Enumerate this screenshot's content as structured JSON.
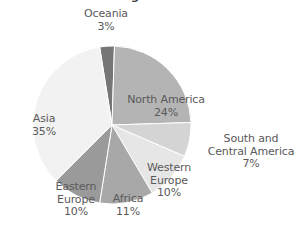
{
  "chart_data": {
    "type": "pie",
    "title": "different regions of the world",
    "xlabel": "",
    "ylabel": "",
    "legend_position": "none",
    "grid": false,
    "start_angle_deg": -9,
    "direction": "clockwise",
    "categories": [
      "Oceania",
      "North America",
      "South and Central America",
      "Western Europe",
      "Africa",
      "Eastern Europe",
      "Asia"
    ],
    "values": [
      3,
      24,
      7,
      10,
      11,
      10,
      35
    ],
    "unit": "%",
    "slices": [
      {
        "name": "Oceania",
        "value": 3,
        "value_label": "3%",
        "label_lines": [
          "Oceania",
          "3%"
        ],
        "color": "#767676",
        "label_placement": "outside-top"
      },
      {
        "name": "North America",
        "value": 24,
        "value_label": "24%",
        "label_lines": [
          "North America",
          "24%"
        ],
        "color": "#b4b4b4",
        "label_placement": "inside"
      },
      {
        "name": "South and Central America",
        "value": 7,
        "value_label": "7%",
        "label_lines": [
          "South and",
          "Central America",
          "7%"
        ],
        "color": "#d4d4d4",
        "label_placement": "outside-right"
      },
      {
        "name": "Western Europe",
        "value": 10,
        "value_label": "10%",
        "label_lines": [
          "Western",
          "Europe",
          "10%"
        ],
        "color": "#e6e6e6",
        "label_placement": "inside"
      },
      {
        "name": "Africa",
        "value": 11,
        "value_label": "11%",
        "label_lines": [
          "Africa",
          "11%"
        ],
        "color": "#a8a8a8",
        "label_placement": "inside"
      },
      {
        "name": "Eastern Europe",
        "value": 10,
        "value_label": "10%",
        "label_lines": [
          "Eastern",
          "Europe",
          "10%"
        ],
        "color": "#9a9a9a",
        "label_placement": "inside"
      },
      {
        "name": "Asia",
        "value": 35,
        "value_label": "35%",
        "label_lines": [
          "Asia",
          "35%"
        ],
        "color": "#f2f2f2",
        "label_placement": "inside"
      }
    ]
  },
  "labels": {
    "oceania": {
      "name": "Oceania",
      "value": "3%"
    },
    "north_america": {
      "name": "North America",
      "value": "24%"
    },
    "south_central_america": {
      "line1": "South and",
      "line2": "Central America",
      "value": "7%"
    },
    "western_europe": {
      "line1": "Western",
      "line2": "Europe",
      "value": "10%"
    },
    "africa": {
      "name": "Africa",
      "value": "11%"
    },
    "eastern_europe": {
      "line1": "Eastern",
      "line2": "Europe",
      "value": "10%"
    },
    "asia": {
      "name": "Asia",
      "value": "35%"
    }
  },
  "title": {
    "text": "different regions of the world"
  },
  "colors": {
    "background": "#ffffff",
    "text": "#5a5a5a",
    "title": "#3a3a3a",
    "slice_border": "#ffffff"
  }
}
